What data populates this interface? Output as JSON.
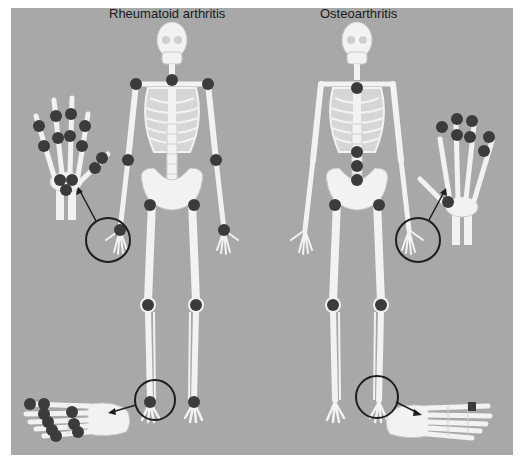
{
  "diagram": {
    "titles": {
      "left": "Rheumatoid arthritis",
      "right": "Osteoarthritis"
    },
    "colors": {
      "background": "#a8a8a8",
      "bone": "#f2f2f2",
      "bone_outline": "#cfcfcf",
      "joint_marker": "#3b3b3b",
      "callout": "#1e1e1e",
      "margin": "#ffffff"
    },
    "panels": [
      {
        "name": "rheumatoid-arthritis",
        "label": "Rheumatoid arthritis",
        "affected_joints": [
          "cervical spine",
          "shoulders",
          "elbows",
          "wrists",
          "hips",
          "knees",
          "ankles",
          "hand MCP joints",
          "hand PIP joints",
          "wrist carpal joints",
          "foot MTP joints",
          "foot tarsal joints"
        ],
        "callouts": [
          "hand (wrist detail)",
          "foot detail"
        ]
      },
      {
        "name": "osteoarthritis",
        "label": "Osteoarthritis",
        "affected_joints": [
          "cervical spine",
          "lumbar spine",
          "hips",
          "knees",
          "hand DIP joints",
          "hand PIP joints",
          "thumb base (CMC)",
          "first MTP joint (foot)"
        ],
        "callouts": [
          "hand (wrist detail)",
          "foot detail"
        ]
      }
    ]
  }
}
